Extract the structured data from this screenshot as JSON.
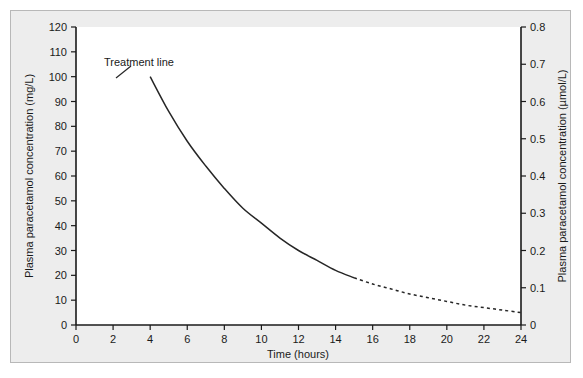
{
  "figure": {
    "background_color": "#ededed",
    "plot_background_color": "#ffffff",
    "border_color": "#b8b8b8",
    "curve_color": "#262626"
  },
  "chart_data": {
    "type": "line",
    "title": "",
    "xlabel": "Time (hours)",
    "ylabel": "Plasma paracetamol concentration (mg/L)",
    "ylabel_right": "Plasma paracetamol concentration (µmol/L)",
    "xlim": [
      0,
      24
    ],
    "ylim": [
      0,
      120
    ],
    "ylim_right": [
      0,
      0.8
    ],
    "grid": false,
    "legend_position": "none",
    "xticks": [
      0,
      2,
      4,
      6,
      8,
      10,
      12,
      14,
      16,
      18,
      20,
      22,
      24
    ],
    "xticklabels": [
      "0",
      "2",
      "4",
      "6",
      "8",
      "10",
      "12",
      "14",
      "16",
      "18",
      "20",
      "22",
      "24"
    ],
    "yticks": [
      0,
      10,
      20,
      30,
      40,
      50,
      60,
      70,
      80,
      90,
      100,
      110,
      120
    ],
    "yticklabels": [
      "0",
      "10",
      "20",
      "30",
      "40",
      "50",
      "60",
      "70",
      "80",
      "90",
      "100",
      "110",
      "120"
    ],
    "yticks_right": [
      0,
      0.1,
      0.2,
      0.3,
      0.4,
      0.5,
      0.6,
      0.7,
      0.8
    ],
    "yticklabels_right": [
      "0",
      "0.1",
      "0.2",
      "0.3",
      "0.4",
      "0.5",
      "0.6",
      "0.7",
      "0.8"
    ],
    "series": [
      {
        "name": "Treatment line (solid segment)",
        "style": "solid",
        "x": [
          4,
          5,
          6,
          7,
          8,
          9,
          10,
          11,
          12,
          13,
          14,
          15
        ],
        "values": [
          100,
          86,
          74,
          64,
          55,
          47,
          41,
          35,
          30,
          26,
          22,
          19
        ]
      },
      {
        "name": "Treatment line (extrapolated segment)",
        "style": "dashed",
        "x": [
          15,
          16,
          17,
          18,
          19,
          20,
          21,
          22,
          23,
          24
        ],
        "values": [
          19,
          16.5,
          14.5,
          12.5,
          11,
          9.5,
          8,
          7,
          6,
          5
        ]
      }
    ],
    "annotations": [
      {
        "text": "Treatment line",
        "x": 5.2,
        "y": 108
      }
    ]
  }
}
